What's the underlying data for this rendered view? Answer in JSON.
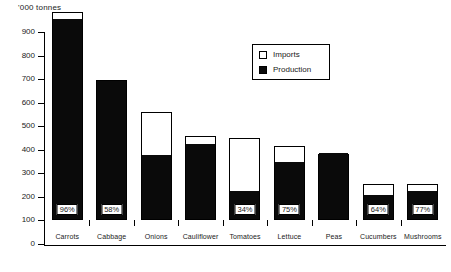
{
  "chart_data": {
    "type": "bar",
    "title": "",
    "subtitle": "",
    "xlabel": "",
    "ylabel": "'000 tonnes",
    "ylim": [
      0,
      900
    ],
    "yticks": [
      0,
      100,
      200,
      300,
      400,
      500,
      600,
      700,
      800,
      900
    ],
    "grid": false,
    "stacked": true,
    "legend_position": "top-right",
    "categories": [
      "Carrots",
      "Cabbage",
      "Onions",
      "Cauliflower",
      "Tomatoes",
      "Lettuce",
      "Peas",
      "Cucumbers",
      "Mushrooms"
    ],
    "series": [
      {
        "name": "Production",
        "color": "#0a0a0a",
        "values": [
          850,
          585,
          270,
          320,
          120,
          240,
          280,
          100,
          120
        ]
      },
      {
        "name": "Imports",
        "color": "#ffffff",
        "values": [
          35,
          10,
          190,
          35,
          230,
          75,
          0,
          55,
          35
        ]
      }
    ],
    "totals": [
      885,
      595,
      460,
      355,
      350,
      315,
      280,
      155,
      155
    ],
    "data_labels": [
      "96%",
      "58%",
      "",
      "",
      "34%",
      "75%",
      "",
      "64%",
      "77%"
    ],
    "data_label_note": "Production share of total supply"
  },
  "legend": {
    "entries": [
      {
        "label": "Imports",
        "swatch": "open"
      },
      {
        "label": "Production",
        "swatch": "filled"
      }
    ]
  },
  "axis": {
    "unit_label": "'000 tonnes",
    "tick_labels": [
      "900",
      "800",
      "700",
      "600",
      "500",
      "400",
      "300",
      "200",
      "100",
      "0"
    ]
  }
}
